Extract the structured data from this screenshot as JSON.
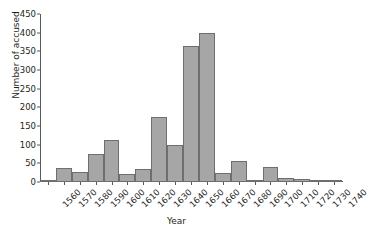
{
  "chart_data": {
    "type": "bar",
    "title": "",
    "xlabel": "Year",
    "ylabel": "Number of accused",
    "categories": [
      "1560",
      "1570",
      "1580",
      "1590",
      "1600",
      "1610",
      "1620",
      "1630",
      "1640",
      "1650",
      "1660",
      "1670",
      "1680",
      "1690",
      "1700",
      "1710",
      "1720",
      "1730",
      "1740"
    ],
    "values": [
      4,
      37,
      28,
      76,
      112,
      22,
      36,
      173,
      100,
      365,
      400,
      25,
      57,
      6,
      39,
      11,
      7,
      1,
      1
    ],
    "ylim": [
      0,
      450
    ],
    "yticks": [
      0,
      50,
      100,
      150,
      200,
      250,
      300,
      350,
      400,
      450
    ],
    "grid": false,
    "legend": false,
    "bar_color": "#a6a6a6",
    "bar_border_color": "#6e6e70",
    "axis_color": "#58595b"
  }
}
